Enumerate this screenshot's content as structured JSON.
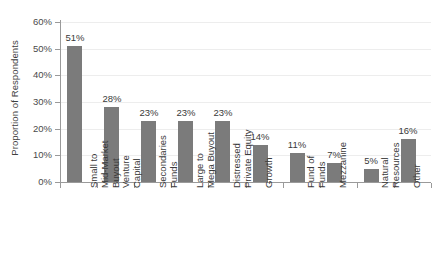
{
  "chart_data": {
    "type": "bar",
    "title": "",
    "xlabel": "",
    "ylabel": "Proportion of Respondents",
    "ylim": [
      0,
      60
    ],
    "ytick_labels": [
      "0%",
      "10%",
      "20%",
      "30%",
      "40%",
      "50%",
      "60%"
    ],
    "ytick_values": [
      0,
      10,
      20,
      30,
      40,
      50,
      60
    ],
    "grid": "horizontal",
    "legend": "none",
    "bar_color": "#7b7b7b",
    "value_suffix": "%",
    "categories": [
      "Small to Mid-Market Buyout",
      "Venture Capital",
      "Secondaries Funds",
      "Large to Mega Buyout",
      "Distressed Private Equity",
      "Growth",
      "Fund of Funds",
      "Mezzanine",
      "Natural Resources",
      "Other"
    ],
    "category_label_lines": [
      [
        "Small to",
        "Mid-Market",
        "Buyout"
      ],
      [
        "Venture",
        "Capital"
      ],
      [
        "Secondaries",
        "Funds"
      ],
      [
        "Large to",
        "Mega Buyout"
      ],
      [
        "Distressed",
        "Private Equity"
      ],
      [
        "Growth"
      ],
      [
        "Fund of",
        "Funds"
      ],
      [
        "Mezzanine"
      ],
      [
        "Natural",
        "Resources"
      ],
      [
        "Other"
      ]
    ],
    "values": [
      51,
      28,
      23,
      23,
      23,
      14,
      11,
      7,
      5,
      16
    ],
    "value_labels": [
      "51%",
      "28%",
      "23%",
      "23%",
      "23%",
      "14%",
      "11%",
      "7%",
      "5%",
      "16%"
    ]
  }
}
